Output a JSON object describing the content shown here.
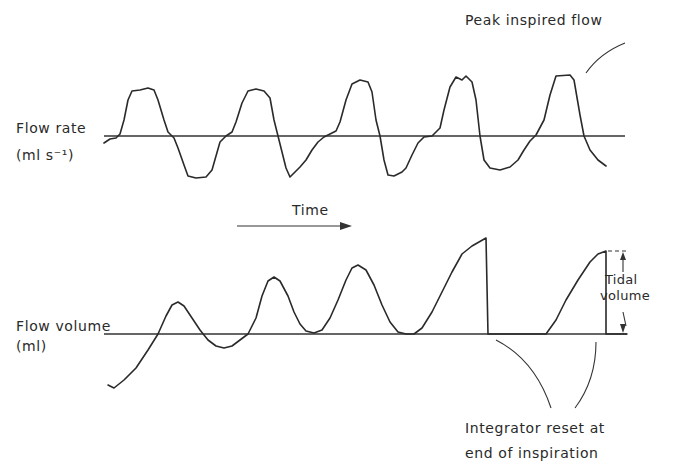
{
  "figure": {
    "flow_rate": {
      "label_line1": "Flow rate",
      "label_line2": "(ml s⁻¹)",
      "baseline_y": 136,
      "baseline_x": [
        104,
        625
      ]
    },
    "time": {
      "label": "Time"
    },
    "flow_volume": {
      "label_line1": "Flow volume",
      "label_line2": "(ml)",
      "baseline_y": 334,
      "baseline_x": [
        104,
        627
      ]
    },
    "annotations": {
      "peak_inspired_flow": "Peak inspired flow",
      "tidal_line1": "Tidal",
      "tidal_line2": "volume",
      "integrator_line1": "Integrator reset at",
      "integrator_line2": "end of inspiration"
    },
    "colors": {
      "ink": "#2a2a2a",
      "background": "#ffffff"
    }
  },
  "chart_data": [
    {
      "type": "line",
      "title": "Flow rate",
      "ylabel": "Flow rate (ml s⁻¹)",
      "xlabel": "Time",
      "grid": false,
      "description": "Respiratory flow rate trace: five inspiratory (positive) plateaus alternating with expiratory (negative) troughs about a zero baseline",
      "series": [
        {
          "name": "flow rate",
          "points": [
            [
              104,
              143
            ],
            [
              110,
              139
            ],
            [
              116,
              138
            ],
            [
              120,
              134
            ],
            [
              124,
              120
            ],
            [
              128,
              100
            ],
            [
              132,
              91
            ],
            [
              140,
              90
            ],
            [
              148,
              88
            ],
            [
              154,
              90
            ],
            [
              158,
              100
            ],
            [
              164,
              120
            ],
            [
              168,
              132
            ],
            [
              174,
              138
            ],
            [
              178,
              148
            ],
            [
              184,
              165
            ],
            [
              188,
              176
            ],
            [
              196,
              178
            ],
            [
              206,
              177
            ],
            [
              212,
              170
            ],
            [
              216,
              156
            ],
            [
              220,
              142
            ],
            [
              226,
              136
            ],
            [
              232,
              132
            ],
            [
              236,
              122
            ],
            [
              242,
              103
            ],
            [
              248,
              91
            ],
            [
              256,
              89
            ],
            [
              264,
              91
            ],
            [
              270,
              98
            ],
            [
              274,
              120
            ],
            [
              278,
              136
            ],
            [
              282,
              152
            ],
            [
              286,
              168
            ],
            [
              290,
              177
            ],
            [
              296,
              171
            ],
            [
              300,
              167
            ],
            [
              306,
              160
            ],
            [
              312,
              150
            ],
            [
              318,
              142
            ],
            [
              324,
              137
            ],
            [
              330,
              134
            ],
            [
              336,
              131
            ],
            [
              340,
              122
            ],
            [
              346,
              100
            ],
            [
              352,
              84
            ],
            [
              360,
              80
            ],
            [
              368,
              82
            ],
            [
              372,
              92
            ],
            [
              376,
              120
            ],
            [
              380,
              136
            ],
            [
              384,
              160
            ],
            [
              388,
              175
            ],
            [
              394,
              176
            ],
            [
              402,
              172
            ],
            [
              406,
              168
            ],
            [
              412,
              155
            ],
            [
              418,
              143
            ],
            [
              424,
              137
            ],
            [
              432,
              136
            ],
            [
              440,
              128
            ],
            [
              444,
              110
            ],
            [
              450,
              87
            ],
            [
              456,
              77
            ],
            [
              462,
              80
            ],
            [
              466,
              76
            ],
            [
              472,
              82
            ],
            [
              476,
              100
            ],
            [
              480,
              136
            ],
            [
              484,
              160
            ],
            [
              490,
              168
            ],
            [
              500,
              170
            ],
            [
              510,
              167
            ],
            [
              518,
              160
            ],
            [
              524,
              150
            ],
            [
              530,
              141
            ],
            [
              536,
              135
            ],
            [
              544,
              120
            ],
            [
              550,
              95
            ],
            [
              556,
              76
            ],
            [
              570,
              75
            ],
            [
              574,
              80
            ],
            [
              580,
              115
            ],
            [
              584,
              136
            ],
            [
              590,
              150
            ],
            [
              598,
              160
            ],
            [
              606,
              166
            ]
          ]
        }
      ],
      "annotations": [
        "Peak inspired flow"
      ]
    },
    {
      "type": "line",
      "title": "Flow volume",
      "ylabel": "Flow volume (ml)",
      "xlabel": "Time",
      "grid": false,
      "description": "Integrated flow volume: drifting sinusoid for three breaths, then integrator reset at end of inspiration producing sawtooth ramps from baseline; tidal volume marked on last ramp",
      "series": [
        {
          "name": "flow volume",
          "points": [
            [
              108,
              385
            ],
            [
              114,
              388
            ],
            [
              124,
              380
            ],
            [
              136,
              368
            ],
            [
              148,
              350
            ],
            [
              158,
              334
            ],
            [
              166,
              316
            ],
            [
              172,
              305
            ],
            [
              178,
              302
            ],
            [
              184,
              306
            ],
            [
              192,
              318
            ],
            [
              200,
              330
            ],
            [
              208,
              340
            ],
            [
              216,
              346
            ],
            [
              224,
              348
            ],
            [
              232,
              346
            ],
            [
              240,
              340
            ],
            [
              248,
              334
            ],
            [
              256,
              318
            ],
            [
              262,
              296
            ],
            [
              268,
              281
            ],
            [
              274,
              277
            ],
            [
              280,
              281
            ],
            [
              288,
              296
            ],
            [
              294,
              312
            ],
            [
              300,
              324
            ],
            [
              306,
              331
            ],
            [
              314,
              333
            ],
            [
              322,
              330
            ],
            [
              330,
              318
            ],
            [
              338,
              300
            ],
            [
              346,
              280
            ],
            [
              352,
              268
            ],
            [
              358,
              265
            ],
            [
              366,
              270
            ],
            [
              374,
              285
            ],
            [
              382,
              305
            ],
            [
              390,
              322
            ],
            [
              398,
              332
            ],
            [
              406,
              334
            ],
            [
              414,
              334
            ],
            [
              422,
              328
            ],
            [
              432,
              312
            ],
            [
              442,
              292
            ],
            [
              452,
              272
            ],
            [
              462,
              254
            ],
            [
              472,
              246
            ],
            [
              486,
              238
            ],
            [
              488,
              334
            ],
            [
              546,
              334
            ],
            [
              556,
              320
            ],
            [
              566,
              300
            ],
            [
              578,
              280
            ],
            [
              590,
              262
            ],
            [
              598,
              254
            ],
            [
              606,
              251
            ],
            [
              606,
              334
            ],
            [
              627,
              334
            ]
          ]
        }
      ],
      "annotations": [
        "Tidal volume",
        "Integrator reset at end of inspiration"
      ]
    }
  ]
}
